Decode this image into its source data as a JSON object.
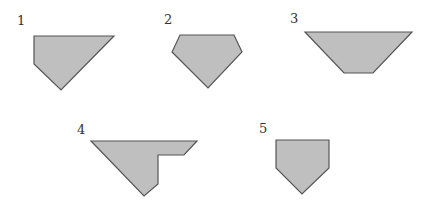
{
  "diagram": {
    "title": "",
    "style": {
      "fill": "#BFBFBF",
      "stroke": "#555555",
      "background": "#FFFFFF",
      "label_color": "#333333"
    },
    "shapes": [
      {
        "id": 1,
        "label": "1",
        "label_pos": [
          17,
          25
        ],
        "points": [
          [
            34,
            36
          ],
          [
            114,
            36
          ],
          [
            61,
            90
          ],
          [
            34,
            64
          ]
        ]
      },
      {
        "id": 2,
        "label": "2",
        "label_pos": [
          164,
          24
        ],
        "points": [
          [
            180,
            35
          ],
          [
            234,
            35
          ],
          [
            242,
            52
          ],
          [
            208,
            88
          ],
          [
            172,
            52
          ]
        ]
      },
      {
        "id": 3,
        "label": "3",
        "label_pos": [
          290,
          23
        ],
        "points": [
          [
            305,
            32
          ],
          [
            412,
            32
          ],
          [
            373,
            73
          ],
          [
            344,
            73
          ]
        ]
      },
      {
        "id": 4,
        "label": "4",
        "label_pos": [
          77,
          134
        ],
        "points": [
          [
            91,
            141
          ],
          [
            197,
            141
          ],
          [
            184,
            155
          ],
          [
            158,
            155
          ],
          [
            158,
            184
          ],
          [
            144,
            196
          ]
        ]
      },
      {
        "id": 5,
        "label": "5",
        "label_pos": [
          259,
          133
        ],
        "points": [
          [
            276,
            140
          ],
          [
            329,
            140
          ],
          [
            329,
            168
          ],
          [
            302,
            194
          ],
          [
            276,
            168
          ]
        ]
      }
    ]
  }
}
